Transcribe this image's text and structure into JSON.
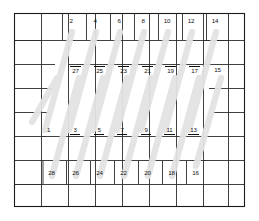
{
  "figure": {
    "title": "",
    "kind": "patent-style hatched grid diagram",
    "colors": {
      "background": "#ffffff",
      "grid_line": "#2b2b2b",
      "border": "#1a1a1a",
      "bar_fill": "#e3e3e3",
      "bar_edge": "#dcdcdc",
      "label_text": "#111111"
    },
    "frame": {
      "x": 14,
      "y": 13,
      "width": 231,
      "height": 194
    },
    "grid": {
      "vertical_x": [
        14,
        41,
        68,
        95,
        122,
        149,
        176,
        203,
        230,
        245
      ],
      "horizontal_y": [
        13,
        40,
        64,
        88,
        112,
        136,
        160,
        184,
        207
      ]
    },
    "bars": {
      "count": 14,
      "angle_deg": 17,
      "fill": "#e3e3e3",
      "upper_row_label_top": [
        "2",
        "4",
        "6",
        "8",
        "10",
        "12",
        "14"
      ],
      "upper_row_label_bottom": [
        "27",
        "25",
        "23",
        "21",
        "19",
        "17",
        "15"
      ],
      "lower_row_label_top": [
        "1",
        "3",
        "5",
        "7",
        "9",
        "11",
        "13"
      ],
      "lower_row_label_bottom": [
        "28",
        "26",
        "24",
        "22",
        "20",
        "18",
        "16"
      ]
    },
    "labels": {
      "top_even": [
        {
          "text": "2",
          "x": 70,
          "y": 21
        },
        {
          "text": "4",
          "x": 95,
          "y": 21
        },
        {
          "text": "6",
          "x": 119,
          "y": 21
        },
        {
          "text": "8",
          "x": 143,
          "y": 21
        },
        {
          "text": "10",
          "x": 167,
          "y": 21
        },
        {
          "text": "12",
          "x": 191,
          "y": 21
        },
        {
          "text": "14",
          "x": 215,
          "y": 21
        }
      ],
      "upper_mid_odd": [
        {
          "text": "27",
          "x": 75,
          "y": 71
        },
        {
          "text": "25",
          "x": 99,
          "y": 71
        },
        {
          "text": "23",
          "x": 123,
          "y": 71
        },
        {
          "text": "21",
          "x": 147,
          "y": 71
        },
        {
          "text": "19",
          "x": 170,
          "y": 71
        },
        {
          "text": "17",
          "x": 194,
          "y": 71
        },
        {
          "text": "15",
          "x": 217,
          "y": 71
        }
      ],
      "lower_mid_odd": [
        {
          "text": "1",
          "x": 48,
          "y": 131
        },
        {
          "text": "3",
          "x": 75,
          "y": 131
        },
        {
          "text": "5",
          "x": 99,
          "y": 131
        },
        {
          "text": "7",
          "x": 122,
          "y": 131
        },
        {
          "text": "9",
          "x": 146,
          "y": 131
        },
        {
          "text": "11",
          "x": 169,
          "y": 131
        },
        {
          "text": "13",
          "x": 193,
          "y": 131
        }
      ],
      "bottom_even": [
        {
          "text": "28",
          "x": 51,
          "y": 173
        },
        {
          "text": "26",
          "x": 75,
          "y": 173
        },
        {
          "text": "24",
          "x": 99,
          "y": 173
        },
        {
          "text": "22",
          "x": 123,
          "y": 173
        },
        {
          "text": "20",
          "x": 147,
          "y": 173
        },
        {
          "text": "18",
          "x": 171,
          "y": 173
        },
        {
          "text": "16",
          "x": 195,
          "y": 173
        }
      ]
    }
  }
}
